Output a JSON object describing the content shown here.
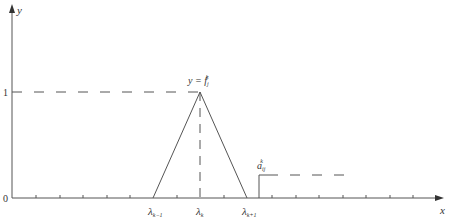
{
  "diagram": {
    "axes": {
      "x_label": "x",
      "y_label": "y",
      "origin_label": "0",
      "y_tick_label": "1"
    },
    "peak_label": {
      "lhs": "y = f",
      "sub": "j",
      "sup": "k"
    },
    "x_tick_labels": [
      {
        "base": "λ",
        "sub": "k−1"
      },
      {
        "base": "λ",
        "sub": "k"
      },
      {
        "base": "λ",
        "sub": "k+1"
      }
    ],
    "step_label": {
      "base": "a",
      "sub": "ij",
      "sup": "k"
    },
    "colors": {
      "line": "#555555",
      "text": "#333333"
    }
  }
}
